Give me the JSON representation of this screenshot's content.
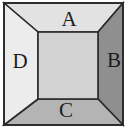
{
  "figure": {
    "name": "one-point-perspective-box-diagram",
    "canvas": {
      "width": 126,
      "height": 132
    },
    "outer_frame": {
      "x": 4,
      "y": 3,
      "width": 119,
      "height": 122
    },
    "inner_rect": {
      "x": 38,
      "y": 32,
      "width": 60,
      "height": 67
    },
    "stroke_color": "#2b2b2b",
    "stroke_width": 1.6
  },
  "faces": [
    {
      "id": "face-a",
      "label": "A",
      "position": "top",
      "fill": "#e2e2e2",
      "label_x": 69,
      "label_y": 21
    },
    {
      "id": "face-b",
      "label": "B",
      "position": "right",
      "fill": "#8f8f8f",
      "label_x": 114,
      "label_y": 62
    },
    {
      "id": "face-c",
      "label": "C",
      "position": "bottom",
      "fill": "#b4b4b4",
      "label_x": 66,
      "label_y": 112
    },
    {
      "id": "face-d",
      "label": "D",
      "position": "left",
      "fill": "#ececec",
      "label_x": 20,
      "label_y": 63
    }
  ],
  "center_panel": {
    "id": "center-panel",
    "label": "",
    "fill": "#d2d2d2"
  }
}
